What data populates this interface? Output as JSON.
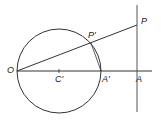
{
  "diagram": {
    "type": "geometry-inversion",
    "stroke_color": "#333333",
    "background": "#ffffff",
    "circle": {
      "center": "C'",
      "cx": 59,
      "cy": 71,
      "r": 42
    },
    "points": {
      "O": {
        "label": "O",
        "x": 17,
        "y": 71
      },
      "C1": {
        "label": "C'",
        "x": 59,
        "y": 71
      },
      "A1": {
        "label": "A'",
        "x": 101,
        "y": 71
      },
      "A": {
        "label": "A",
        "x": 137,
        "y": 71
      },
      "P1": {
        "label": "P'",
        "x": 91,
        "y": 43
      },
      "P": {
        "label": "P",
        "x": 137,
        "y": 25
      }
    },
    "lines": [
      {
        "name": "axis-line",
        "from": "O",
        "to_x": 152,
        "to_y": 71
      },
      {
        "name": "vertical-line",
        "x": 137,
        "y1": 5,
        "y2": 112
      },
      {
        "name": "ray-OP",
        "from": "O",
        "to": "P"
      },
      {
        "name": "chord-P1A1",
        "from": "P'",
        "to": "A'"
      }
    ]
  }
}
